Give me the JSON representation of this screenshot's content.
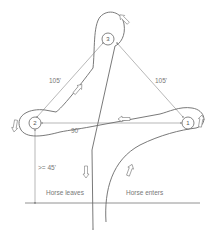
{
  "diagram": {
    "type": "barrel-racing-pattern",
    "colors": {
      "line": "#6a6a6a",
      "text": "#777777",
      "background": "#ffffff"
    },
    "barrels": [
      {
        "id": "1",
        "label": "1",
        "x": 188,
        "y": 123
      },
      {
        "id": "2",
        "label": "2",
        "x": 35,
        "y": 123
      },
      {
        "id": "3",
        "label": "3",
        "x": 108,
        "y": 39
      }
    ],
    "distances": {
      "left_side": "105'",
      "right_side": "105'",
      "base": "90'",
      "start_line_to_barrel": ">= 45'"
    },
    "labels": {
      "horse_leaves": "Horse leaves",
      "horse_enters": "Horse enters"
    },
    "direction_arrows": [
      {
        "name": "arrow-near-barrel-3",
        "direction": "up-left"
      },
      {
        "name": "arrow-left-side",
        "direction": "up-right"
      },
      {
        "name": "arrow-base",
        "direction": "left"
      },
      {
        "name": "arrow-barrel-2",
        "direction": "down"
      },
      {
        "name": "arrow-barrel-1",
        "direction": "up"
      },
      {
        "name": "arrow-horse-leaves",
        "direction": "down"
      },
      {
        "name": "arrow-horse-enters",
        "direction": "up"
      }
    ]
  }
}
